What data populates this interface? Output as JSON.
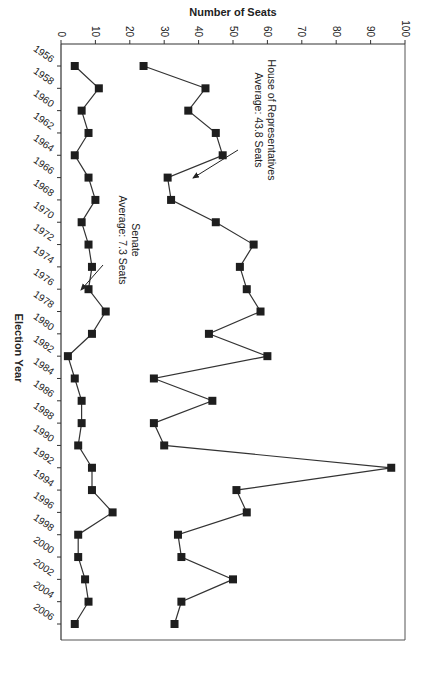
{
  "chart_data": {
    "type": "line",
    "title": "",
    "xlabel": "Election Year",
    "ylabel": "Number of Seats",
    "ylim": [
      0,
      100
    ],
    "yticks": [
      0,
      10,
      20,
      30,
      40,
      50,
      60,
      70,
      80,
      90,
      100
    ],
    "grid": false,
    "legend": null,
    "orientation_note": "figure printed rotated 90 degrees clockwise",
    "x": [
      1956,
      1958,
      1960,
      1962,
      1964,
      1966,
      1968,
      1970,
      1972,
      1974,
      1976,
      1978,
      1980,
      1982,
      1984,
      1986,
      1988,
      1990,
      1992,
      1994,
      1996,
      1998,
      2000,
      2002,
      2004,
      2006
    ],
    "series": [
      {
        "name": "House of Representatives",
        "values": [
          24,
          42,
          37,
          45,
          47,
          31,
          32,
          45,
          56,
          52,
          54,
          58,
          43,
          60,
          27,
          44,
          27,
          30,
          96,
          51,
          54,
          34,
          35,
          50,
          35,
          33
        ]
      },
      {
        "name": "Senate",
        "values": [
          4,
          11,
          6,
          8,
          4,
          8,
          10,
          6,
          8,
          9,
          8,
          13,
          9,
          2,
          4,
          6,
          6,
          5,
          9,
          9,
          15,
          5,
          5,
          7,
          8,
          4
        ]
      }
    ],
    "annotations": [
      {
        "lines": [
          "House of Representatives",
          "Average:  43.8 Seats"
        ],
        "points_to": "House of Representatives"
      },
      {
        "lines": [
          "Senate",
          "Average: 7.3 Seats"
        ],
        "points_to": "Senate"
      }
    ]
  }
}
